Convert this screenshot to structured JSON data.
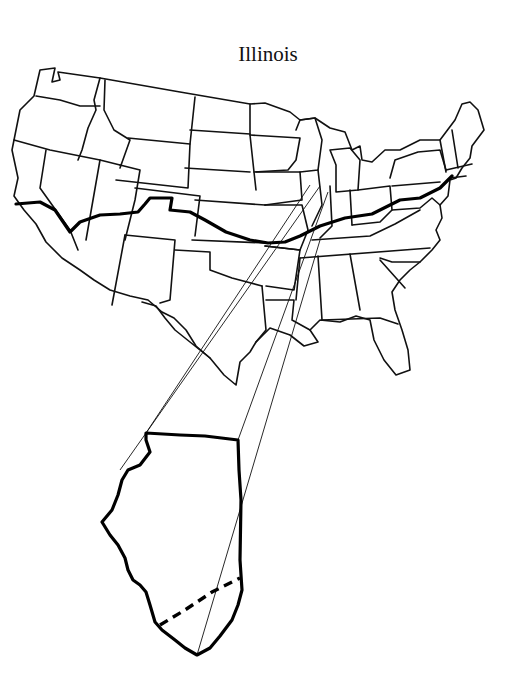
{
  "title": "Illinois",
  "figure": {
    "inset": {
      "state": "Illinois",
      "has_dashed_division": true
    },
    "colors": {
      "line": "#111111",
      "background": "#ffffff"
    }
  }
}
